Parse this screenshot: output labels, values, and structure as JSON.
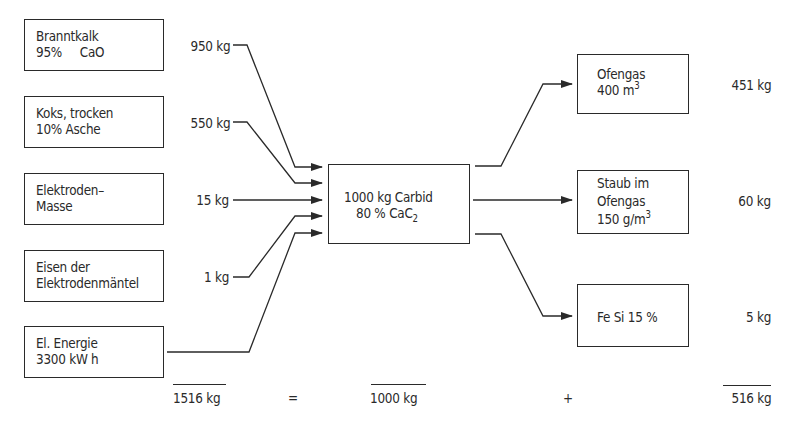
{
  "diagram": {
    "type": "mass-balance flow diagram",
    "language": "de",
    "inputs": [
      {
        "id": "branntkalk",
        "line1": "Branntkalk",
        "line2": "95%     CaO",
        "amount": "950 kg"
      },
      {
        "id": "koks",
        "line1": "Koks, trocken",
        "line2": "10% Asche",
        "amount": "550 kg"
      },
      {
        "id": "elektrodenmasse",
        "line1": "Elektroden–",
        "line2": "Masse",
        "amount": "15 kg"
      },
      {
        "id": "eisen",
        "line1": "Eisen der",
        "line2": "Elektrodenmäntel",
        "amount": "1 kg"
      },
      {
        "id": "energie",
        "line1": "El. Energie",
        "line2": "3300 kW h",
        "amount": ""
      }
    ],
    "center": {
      "line1": "1000 kg Carbid",
      "line2_main": "80 % CaC",
      "line2_sub": "2"
    },
    "outputs": [
      {
        "id": "ofengas",
        "line1": "Ofengas",
        "line2_main": "400 m",
        "line2_sup": "3",
        "line3": "",
        "amount": "451 kg"
      },
      {
        "id": "staub",
        "line1": "Staub im",
        "line2": "Ofengas",
        "line3_main": "150 g/m",
        "line3_sup": "3",
        "amount": "60 kg"
      },
      {
        "id": "fesi",
        "line1": "Fe Si 15 %",
        "amount": "5 kg"
      }
    ],
    "balance": {
      "input_total": "1516 kg",
      "equals": "=",
      "product": "1000 kg",
      "plus": "+",
      "output_total": "516 kg"
    },
    "colors": {
      "ink": "#2a2a2a",
      "background": "#ffffff"
    }
  }
}
